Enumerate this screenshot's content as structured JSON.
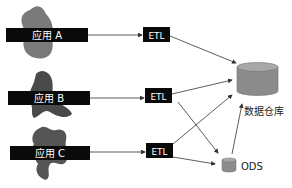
{
  "sources": [
    {
      "label": "应用 A"
    },
    {
      "label": "应用 B"
    },
    {
      "label": "应用 C"
    }
  ],
  "etl": [
    {
      "label": "ETL"
    },
    {
      "label": "ETL"
    },
    {
      "label": "ETL"
    }
  ],
  "warehouse": {
    "label": "数据仓库"
  },
  "ods": {
    "label": "ODS"
  },
  "colors": {
    "box": "#0a0a0a",
    "blob": "#5a5a5a",
    "blob_light": "#7a7a7a",
    "cylinder": "#8c8c8c",
    "cylinder_top": "#a8a8a8",
    "arrow": "#333333"
  }
}
